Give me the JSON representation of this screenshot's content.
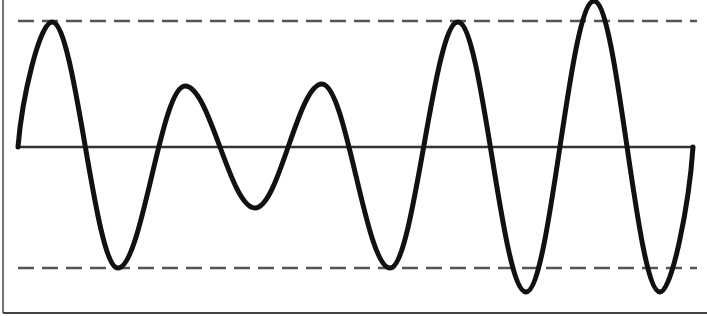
{
  "diagram": {
    "type": "waveform",
    "colors": {
      "background": "#ffffff",
      "wave": "#111111",
      "baseline": "#333333",
      "threshold": "#555555",
      "frame": "#444444"
    },
    "frame": {
      "left_x": 3,
      "bottom_y": 313,
      "right_x": 707,
      "top_y": 0
    },
    "baseline": {
      "y": 147,
      "x_start": 18,
      "x_end": 693
    },
    "upper_threshold": {
      "y": 21,
      "x_start": 18,
      "x_end": 697,
      "style": "dashed"
    },
    "lower_threshold": {
      "y": 268,
      "x_start": 18,
      "x_end": 697,
      "style": "dashed"
    },
    "wave_points": [
      {
        "x": 18,
        "y": 147,
        "kind": "start"
      },
      {
        "x": 52,
        "y": 22,
        "kind": "peak"
      },
      {
        "x": 118,
        "y": 268,
        "kind": "trough"
      },
      {
        "x": 185,
        "y": 86,
        "kind": "peak"
      },
      {
        "x": 255,
        "y": 208,
        "kind": "trough"
      },
      {
        "x": 322,
        "y": 84,
        "kind": "peak"
      },
      {
        "x": 390,
        "y": 268,
        "kind": "trough"
      },
      {
        "x": 458,
        "y": 22,
        "kind": "peak"
      },
      {
        "x": 526,
        "y": 292,
        "kind": "trough"
      },
      {
        "x": 594,
        "y": 1,
        "kind": "peak"
      },
      {
        "x": 660,
        "y": 292,
        "kind": "trough"
      },
      {
        "x": 693,
        "y": 147,
        "kind": "end"
      }
    ]
  }
}
